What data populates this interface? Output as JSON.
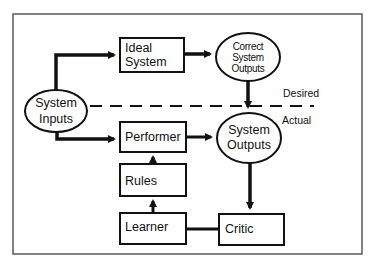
{
  "diagram": {
    "nodes": {
      "system_inputs": {
        "line1": "System",
        "line2": "Inputs",
        "shape": "ellipse"
      },
      "ideal_system": {
        "line1": "Ideal",
        "line2": "System",
        "shape": "rectangle"
      },
      "correct_outputs": {
        "line1": "Correct",
        "line2": "System",
        "line3": "Outputs",
        "shape": "ellipse"
      },
      "performer": {
        "label": "Performer",
        "shape": "rectangle"
      },
      "system_outputs": {
        "line1": "System",
        "line2": "Outputs",
        "shape": "ellipse"
      },
      "rules": {
        "label": "Rules",
        "shape": "rectangle"
      },
      "learner": {
        "label": "Learner",
        "shape": "rectangle"
      },
      "critic": {
        "label": "Critic",
        "shape": "rectangle"
      }
    },
    "separator": {
      "style": "dashed",
      "above_label": "Desired",
      "below_label": "Actual"
    },
    "edges": [
      {
        "from": "System Inputs",
        "to": "Ideal System",
        "arrow": true
      },
      {
        "from": "System Inputs",
        "to": "Performer",
        "arrow": true
      },
      {
        "from": "Ideal System",
        "to": "Correct System Outputs",
        "arrow": true
      },
      {
        "from": "Correct System Outputs",
        "to": "System Outputs",
        "arrow": true
      },
      {
        "from": "Performer",
        "to": "System Outputs",
        "arrow": true
      },
      {
        "from": "Rules",
        "to": "Performer",
        "arrow": true
      },
      {
        "from": "Learner",
        "to": "Rules",
        "arrow": true
      },
      {
        "from": "System Outputs",
        "to": "Critic",
        "arrow": true
      },
      {
        "from": "Critic",
        "to": "Learner",
        "arrow": false
      }
    ],
    "colors": {
      "stroke": "#111111",
      "frame": "#5a5a5a",
      "background": "#ffffff"
    }
  }
}
